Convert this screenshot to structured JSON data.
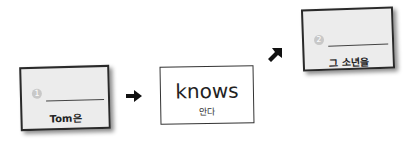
{
  "cards": [
    {
      "number": "1",
      "label": "Tom은"
    },
    {
      "word": "knows",
      "translation": "안다"
    },
    {
      "number": "2",
      "label": "그 소년을"
    }
  ],
  "arrows": [
    "arrow-right",
    "arrow-up-right"
  ],
  "colors": {
    "card_fill": "#ececec",
    "border": "#2a2a2a",
    "number_circle": "#c8c8c8"
  }
}
